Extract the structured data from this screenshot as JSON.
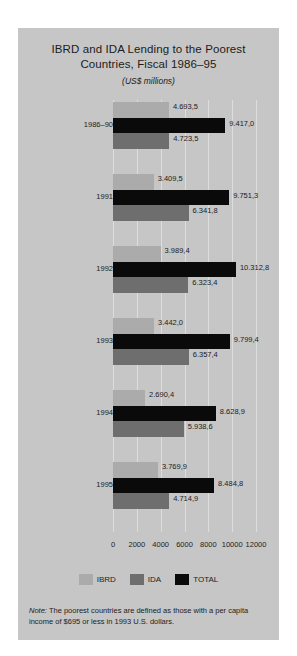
{
  "chart_data": {
    "type": "bar",
    "orientation": "horizontal",
    "title": "IBRD and IDA Lending to the Poorest Countries, Fiscal 1986–95",
    "title_lines": [
      "IBRD and IDA Lending to the Poorest",
      "Countries, Fiscal 1986–95"
    ],
    "subtitle": "(US$ millions)",
    "xlabel": "",
    "ylabel": "",
    "xlim": [
      0,
      12000
    ],
    "xticks": [
      0,
      2000,
      4000,
      6000,
      8000,
      10000,
      12000
    ],
    "xtick_labels": [
      "0",
      "2000",
      "4000",
      "6000",
      "8000",
      "10000",
      "12000"
    ],
    "grid": true,
    "legend_position": "bottom",
    "categories": [
      "1986–90",
      "1991",
      "1992",
      "1993",
      "1994",
      "1995"
    ],
    "series": [
      {
        "name": "IBRD",
        "color": "#ababab",
        "values": [
          4693.5,
          3409.5,
          3989.4,
          3442.0,
          2690.4,
          3769.9
        ],
        "labels": [
          "4.693,5",
          "3.409,5",
          "3.989,4",
          "3.442,0",
          "2.690,4",
          "3.769,9"
        ]
      },
      {
        "name": "IDA",
        "color": "#6e6e6e",
        "values": [
          4723.5,
          6341.8,
          6323.4,
          6357.4,
          5938.6,
          4714.9
        ],
        "labels": [
          "4.723,5",
          "6.341,8",
          "6.323,4",
          "6.357,4",
          "5.938,6",
          "4.714,9"
        ]
      },
      {
        "name": "TOTAL",
        "color": "#0a0a0a",
        "values": [
          9417.0,
          9751.3,
          10312.8,
          9799.4,
          8628.9,
          8484.8
        ],
        "labels": [
          "9.417,0",
          "9.751,3",
          "10.312,8",
          "9.799,4",
          "8.628,9",
          "8.484,8"
        ]
      }
    ],
    "note": "Note: The poorest countries are defined as those with a per capita income of $695 or less in 1993 U.S. dollars.",
    "note_lines": [
      "Note: The poorest countries are defined as those with a per capita",
      "income of $695 or less in 1993 U.S. dollars."
    ],
    "note_label": "Note:",
    "note_body_lines": [
      " The poorest countries are defined as those with a per capita",
      "income of $695 or less in 1993 U.S. dollars."
    ]
  },
  "colors": {
    "panel_background": "#c6c6c6",
    "page_background": "#ffffff",
    "gridline": "#dddddd",
    "text": "#1c1c1c",
    "ibrd": "#ababab",
    "ida": "#6e6e6e",
    "total": "#0a0a0a"
  }
}
